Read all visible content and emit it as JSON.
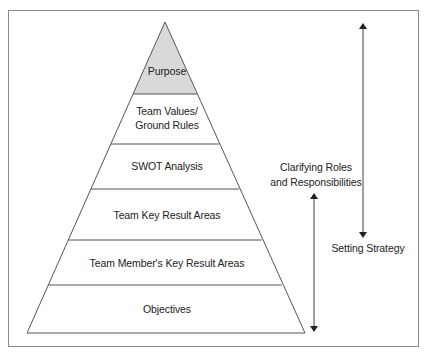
{
  "diagram": {
    "type": "pyramid",
    "colors": {
      "stroke": "#555555",
      "frame": "#8a8a8a",
      "apex_fill": "#d9d9d9",
      "layer_fill": "#ffffff",
      "text": "#222222"
    },
    "layers": [
      {
        "label": "Purpose",
        "highlighted": true
      },
      {
        "label": "Team Values/",
        "label2": "Ground Rules",
        "highlighted": false
      },
      {
        "label": "SWOT Analysis",
        "highlighted": false
      },
      {
        "label": "Team Key Result Areas",
        "highlighted": false
      },
      {
        "label": "Team Member's Key Result Areas",
        "highlighted": false
      },
      {
        "label": "Objectives",
        "highlighted": false
      }
    ],
    "annotations": {
      "clarifying": {
        "line1": "Clarifying Roles",
        "line2": "and Responsibilities"
      },
      "strategy": {
        "label": "Setting Strategy"
      }
    }
  }
}
